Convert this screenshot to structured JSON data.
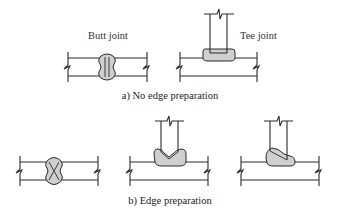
{
  "figure": {
    "part_a": {
      "caption": "a) No edge preparation",
      "joints": [
        {
          "id": "butt",
          "label": "Butt joint"
        },
        {
          "id": "tee",
          "label": "Tee joint"
        }
      ]
    },
    "part_b": {
      "caption": "b) Edge preparation",
      "joints": [
        {
          "id": "butt-double-v",
          "label": ""
        },
        {
          "id": "tee-double-bevel",
          "label": ""
        },
        {
          "id": "tee-single-bevel",
          "label": ""
        }
      ]
    },
    "colors": {
      "line": "#2a2a2a",
      "weld_fill": "#cfcfcf",
      "text": "#333333",
      "background": "#ffffff"
    }
  }
}
